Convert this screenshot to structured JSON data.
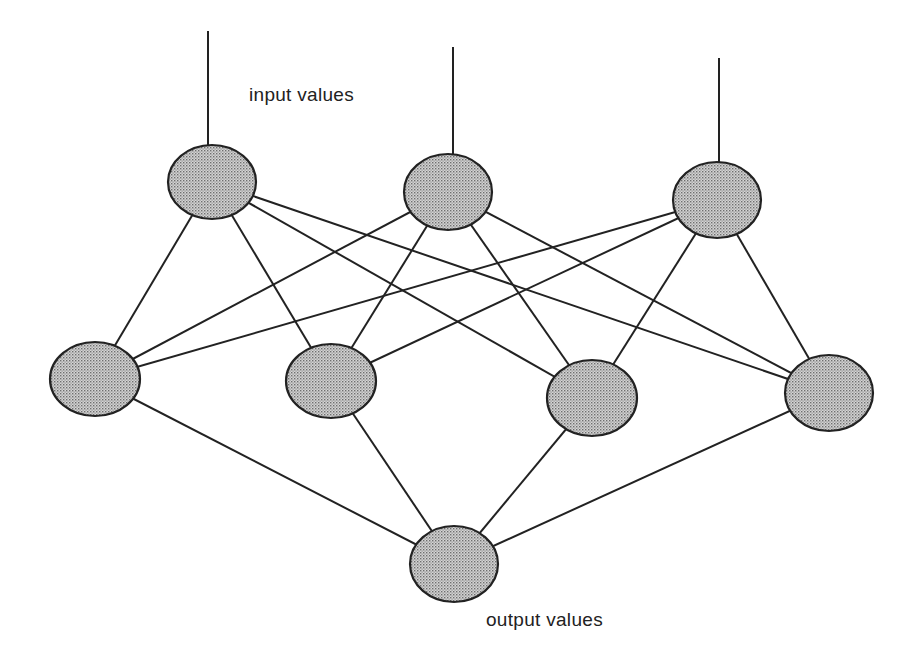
{
  "labels": {
    "input": "input values",
    "output": "output values"
  },
  "colors": {
    "line": "#222222",
    "node_fill": "#c8c8c8",
    "node_dot": "#7a7a7a",
    "background": "#ffffff"
  },
  "network": {
    "input_nodes": [
      {
        "id": "i1",
        "cx": 212,
        "cy": 182,
        "rx": 44,
        "ry": 37,
        "input_line_top": 31,
        "input_line_x": 208
      },
      {
        "id": "i2",
        "cx": 448,
        "cy": 192,
        "rx": 44,
        "ry": 38,
        "input_line_top": 47,
        "input_line_x": 453
      },
      {
        "id": "i3",
        "cx": 717,
        "cy": 200,
        "rx": 44,
        "ry": 38,
        "input_line_top": 58,
        "input_line_x": 719
      }
    ],
    "hidden_nodes": [
      {
        "id": "h1",
        "cx": 95,
        "cy": 379,
        "rx": 45,
        "ry": 37
      },
      {
        "id": "h2",
        "cx": 331,
        "cy": 381,
        "rx": 45,
        "ry": 37
      },
      {
        "id": "h3",
        "cx": 592,
        "cy": 398,
        "rx": 45,
        "ry": 38
      },
      {
        "id": "h4",
        "cx": 829,
        "cy": 393,
        "rx": 44,
        "ry": 38
      }
    ],
    "output_nodes": [
      {
        "id": "o1",
        "cx": 454,
        "cy": 564,
        "rx": 44,
        "ry": 38
      }
    ]
  }
}
